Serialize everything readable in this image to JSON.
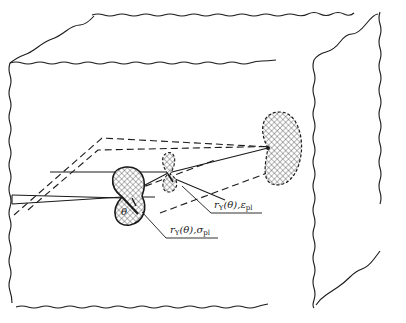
{
  "diagram": {
    "type": "crack-tip plastic zone schematic",
    "colors": {
      "ink": "#1a1a1a",
      "background": "#ffffff"
    },
    "labels": {
      "angle": "θ",
      "plastic_zone_strain": {
        "main": "r",
        "sub1": "Y",
        "mid": "(θ),ε",
        "sub2": "pl"
      },
      "plastic_zone_stress": {
        "main": "r",
        "sub1": "Y",
        "mid": "(θ),σ",
        "sub2": "pl"
      }
    },
    "elements": [
      "solid-block",
      "crack-front",
      "plastic-zone-front",
      "plastic-zone-middle",
      "plastic-zone-back",
      "dashed-crack-plane"
    ]
  }
}
